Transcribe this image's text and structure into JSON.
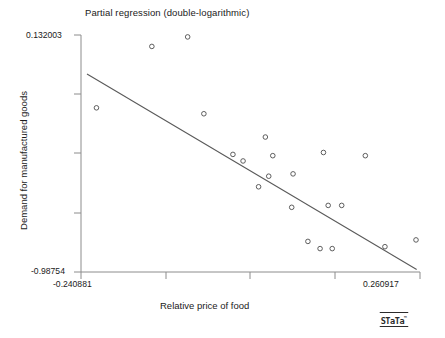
{
  "chart_data": {
    "type": "scatter",
    "title": "Partial regression (double-logarithmic)",
    "xlabel": "Relative price of food",
    "ylabel": "Demand for manufactured goods",
    "xlim": [
      -0.240881,
      0.260917
    ],
    "ylim": [
      -0.98754,
      0.132003
    ],
    "x_tick_labels": [
      "-0.240881",
      "0.260917"
    ],
    "y_tick_labels": [
      "0.132003",
      "-0.98754"
    ],
    "x_ticks": [
      -0.240881,
      -0.115422,
      0.010037,
      0.135496,
      0.260917
    ],
    "y_ticks": [
      0.132003,
      -0.147883,
      -0.42777,
      -0.707657,
      -0.98754
    ],
    "grid": false,
    "legend": false,
    "marker": "open-circle",
    "points": [
      {
        "x": -0.083,
        "y": 0.123
      },
      {
        "x": -0.136,
        "y": 0.078
      },
      {
        "x": -0.218,
        "y": -0.212
      },
      {
        "x": -0.059,
        "y": -0.24
      },
      {
        "x": 0.032,
        "y": -0.35
      },
      {
        "x": -0.016,
        "y": -0.432
      },
      {
        "x": -0.001,
        "y": -0.463
      },
      {
        "x": 0.043,
        "y": -0.438
      },
      {
        "x": 0.118,
        "y": -0.423
      },
      {
        "x": 0.18,
        "y": -0.438
      },
      {
        "x": 0.037,
        "y": -0.535
      },
      {
        "x": 0.073,
        "y": -0.524
      },
      {
        "x": 0.022,
        "y": -0.585
      },
      {
        "x": 0.071,
        "y": -0.682
      },
      {
        "x": 0.125,
        "y": -0.673
      },
      {
        "x": 0.145,
        "y": -0.673
      },
      {
        "x": 0.095,
        "y": -0.843
      },
      {
        "x": 0.113,
        "y": -0.877
      },
      {
        "x": 0.131,
        "y": -0.877
      },
      {
        "x": 0.209,
        "y": -0.868
      },
      {
        "x": 0.255,
        "y": -0.836
      }
    ],
    "fit_line": {
      "x_start": -0.232,
      "y_start": -0.052,
      "x_end": 0.256,
      "y_end": -0.976
    }
  },
  "branding": {
    "logo_text": "STaTa",
    "trademark": "™"
  },
  "colors": {
    "background": "#ffffff",
    "axis": "#8c8c8c",
    "marker_stroke": "#4d4d4d",
    "fit_line": "#5a5a5a",
    "text": "#1a1a1a"
  }
}
